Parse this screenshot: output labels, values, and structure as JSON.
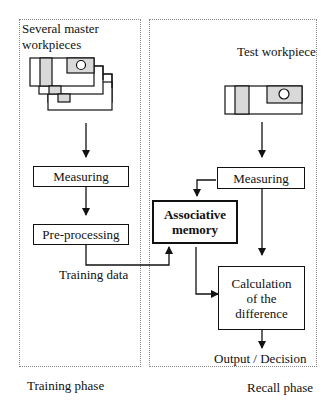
{
  "training_panel": {
    "title_line1": "Several master",
    "title_line2": "workpieces",
    "caption": "Training phase",
    "steps": [
      "Measuring",
      "Pre-processing"
    ],
    "edge_label": "Training data"
  },
  "recall_panel": {
    "title": "Test workpiece",
    "caption": "Recall phase",
    "measuring": "Measuring",
    "memory_line1": "Associative",
    "memory_line2": "memory",
    "calc_line1": "Calculation",
    "calc_line2": "of the",
    "calc_line3": "difference",
    "output": "Output / Decision"
  },
  "colors": {
    "stroke": "#111111",
    "fill_shade": "#d9d9d9",
    "panel_border": "#888888"
  }
}
